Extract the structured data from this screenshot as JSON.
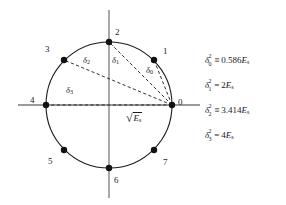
{
  "figure": {
    "axes": {
      "horizontal": {
        "y": 105,
        "x1": 18,
        "x2": 200,
        "color": "#7a7a7a"
      },
      "vertical": {
        "x": 109,
        "y1": 10,
        "y2": 198,
        "color": "#7a7a7a"
      }
    },
    "circle": {
      "cx": 109,
      "cy": 105,
      "r": 63,
      "stroke": "#1a1a1a",
      "stroke_width": 1.1
    },
    "point_radius": 3.2,
    "point_color": "#111111",
    "dash_color": "#1a1a1a",
    "constellation": [
      {
        "label": "0",
        "angle_deg": 0,
        "x": 172,
        "y": 105,
        "lx": 178,
        "ly": 98
      },
      {
        "label": "1",
        "angle_deg": 45,
        "x": 154,
        "y": 60,
        "lx": 163,
        "ly": 47
      },
      {
        "label": "2",
        "angle_deg": 90,
        "x": 109,
        "y": 42,
        "lx": 115,
        "ly": 28
      },
      {
        "label": "3",
        "angle_deg": 135,
        "x": 64,
        "y": 60,
        "lx": 45,
        "ly": 45
      },
      {
        "label": "4",
        "angle_deg": 180,
        "x": 46,
        "y": 105,
        "lx": 30,
        "ly": 96
      },
      {
        "label": "5",
        "angle_deg": 225,
        "x": 64,
        "y": 150,
        "lx": 48,
        "ly": 157
      },
      {
        "label": "6",
        "angle_deg": 270,
        "x": 109,
        "y": 168,
        "lx": 114,
        "ly": 176
      },
      {
        "label": "7",
        "angle_deg": 315,
        "x": 154,
        "y": 150,
        "lx": 163,
        "ly": 158
      }
    ],
    "distance_lines": [
      {
        "name": "delta-0-line",
        "from": "0",
        "to": "1",
        "x1": 172,
        "y1": 105,
        "x2": 154,
        "y2": 60
      },
      {
        "name": "delta-1-line",
        "from": "0",
        "to": "2",
        "x1": 172,
        "y1": 105,
        "x2": 109,
        "y2": 42
      },
      {
        "name": "delta-2-line",
        "from": "0",
        "to": "3",
        "x1": 172,
        "y1": 105,
        "x2": 64,
        "y2": 60
      },
      {
        "name": "delta-3-line",
        "from": "0",
        "to": "4",
        "x1": 172,
        "y1": 105,
        "x2": 46,
        "y2": 105
      }
    ],
    "distance_labels": [
      {
        "name": "delta-0-label",
        "symbol": "δ",
        "sub": "0",
        "x": 146,
        "y": 66
      },
      {
        "name": "delta-1-label",
        "symbol": "δ",
        "sub": "1",
        "x": 112,
        "y": 56
      },
      {
        "name": "delta-2-label",
        "symbol": "δ",
        "sub": "2",
        "x": 83,
        "y": 56
      },
      {
        "name": "delta-3-label",
        "symbol": "δ",
        "sub": "3",
        "x": 66,
        "y": 86
      }
    ],
    "radius_annotation": {
      "sqrt_sign": "√",
      "radicand": "E",
      "radicand_sub": "s",
      "x": 126,
      "y": 112
    }
  },
  "equations": [
    {
      "name": "equation-delta0",
      "symbol": "δ",
      "subscript": "0",
      "superscript": "2",
      "relation": "≡",
      "coefficient": "0.586",
      "energy": "E",
      "energy_sub": "s"
    },
    {
      "name": "equation-delta1",
      "symbol": "δ",
      "subscript": "1",
      "superscript": "2",
      "relation": "=",
      "coefficient": "2",
      "energy": "E",
      "energy_sub": "s"
    },
    {
      "name": "equation-delta2",
      "symbol": "δ",
      "subscript": "2",
      "superscript": "2",
      "relation": "≡",
      "coefficient": "3.414",
      "energy": "E",
      "energy_sub": "s"
    },
    {
      "name": "equation-delta3",
      "symbol": "δ",
      "subscript": "3",
      "superscript": "2",
      "relation": "=",
      "coefficient": "4",
      "energy": "E",
      "energy_sub": "s"
    }
  ]
}
